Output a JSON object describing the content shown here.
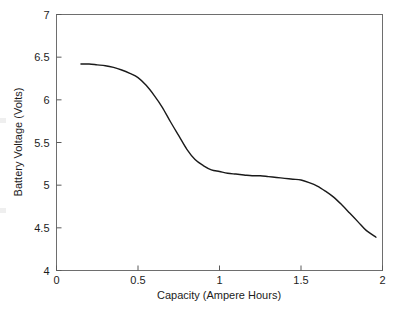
{
  "chart_data": {
    "type": "line",
    "title": "",
    "xlabel": "Capacity (Ampere Hours)",
    "ylabel": "Battery Voltage (Volts)",
    "xlim": [
      0,
      2
    ],
    "ylim": [
      4,
      7
    ],
    "xticks": [
      0,
      0.5,
      1,
      1.5,
      2
    ],
    "xtick_labels": [
      "0",
      "0.5",
      "1",
      "1.5",
      "2"
    ],
    "yticks": [
      4,
      4.5,
      5,
      5.5,
      6,
      6.5,
      7
    ],
    "ytick_labels": [
      "4",
      "4.5",
      "5",
      "5.5",
      "6",
      "6.5",
      "7"
    ],
    "grid": false,
    "legend": false,
    "legend_position": "none",
    "line_color": "#1a1a1a",
    "line_width": 1.4,
    "background_color": "#ffffff",
    "frame": "box",
    "series": [
      {
        "name": "Battery discharge curve",
        "x": [
          0.15,
          0.2,
          0.25,
          0.3,
          0.35,
          0.4,
          0.45,
          0.5,
          0.55,
          0.6,
          0.65,
          0.7,
          0.75,
          0.8,
          0.85,
          0.9,
          0.95,
          1.0,
          1.05,
          1.1,
          1.15,
          1.2,
          1.25,
          1.3,
          1.35,
          1.4,
          1.45,
          1.5,
          1.55,
          1.6,
          1.65,
          1.7,
          1.75,
          1.8,
          1.85,
          1.9,
          1.96
        ],
        "y": [
          6.42,
          6.42,
          6.41,
          6.4,
          6.38,
          6.35,
          6.31,
          6.26,
          6.17,
          6.05,
          5.91,
          5.74,
          5.58,
          5.42,
          5.3,
          5.23,
          5.18,
          5.16,
          5.14,
          5.13,
          5.12,
          5.11,
          5.11,
          5.1,
          5.09,
          5.08,
          5.07,
          5.06,
          5.03,
          4.99,
          4.93,
          4.86,
          4.77,
          4.67,
          4.57,
          4.47,
          4.39
        ]
      }
    ],
    "annotations": []
  }
}
